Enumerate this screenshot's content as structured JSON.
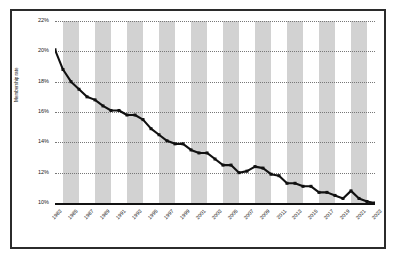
{
  "chart_data": {
    "type": "line",
    "title": "",
    "xlabel": "",
    "ylabel": "Membership rate",
    "ylim": [
      10,
      22
    ],
    "y_ticks": [
      "10%",
      "12%",
      "14%",
      "16%",
      "18%",
      "20%",
      "22%"
    ],
    "y_tick_values": [
      10,
      12,
      14,
      16,
      18,
      20,
      22
    ],
    "xlim": [
      1983,
      2023
    ],
    "x_tick_labels": [
      "1983",
      "1985",
      "1987",
      "1989",
      "1991",
      "1993",
      "1995",
      "1997",
      "1999",
      "2001",
      "2003",
      "2005",
      "2007",
      "2009",
      "2011",
      "2013",
      "2015",
      "2017",
      "2019",
      "2021",
      "2023"
    ],
    "grid": true,
    "legend": false,
    "marker": "square",
    "line_color": "#111111",
    "band_color": "#d2d2d2",
    "band_note": "alternating two-year vertical shading",
    "x": [
      1983,
      1984,
      1985,
      1986,
      1987,
      1988,
      1989,
      1990,
      1991,
      1992,
      1993,
      1994,
      1995,
      1996,
      1997,
      1998,
      1999,
      2000,
      2001,
      2002,
      2003,
      2004,
      2005,
      2006,
      2007,
      2008,
      2009,
      2010,
      2011,
      2012,
      2013,
      2014,
      2015,
      2016,
      2017,
      2018,
      2019,
      2020,
      2021,
      2022,
      2023
    ],
    "values": [
      20.1,
      18.8,
      18.0,
      17.5,
      17.0,
      16.8,
      16.4,
      16.1,
      16.1,
      15.8,
      15.8,
      15.5,
      14.9,
      14.5,
      14.1,
      13.9,
      13.9,
      13.5,
      13.3,
      13.3,
      12.9,
      12.5,
      12.5,
      12.0,
      12.1,
      12.4,
      12.3,
      11.9,
      11.8,
      11.3,
      11.3,
      11.1,
      11.1,
      10.7,
      10.7,
      10.5,
      10.3,
      10.8,
      10.3,
      10.1,
      10.0
    ]
  }
}
